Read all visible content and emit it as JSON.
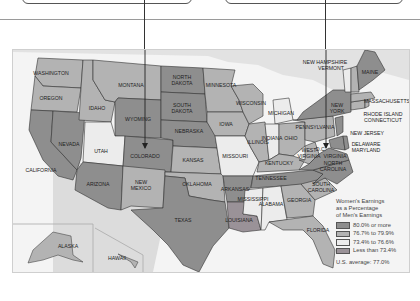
{
  "map": {
    "legend": {
      "title_lines": [
        "Women's Earnings",
        "as a Percentage",
        "of Men's Earnings"
      ],
      "classes": [
        {
          "label": "80.0% or more",
          "color": "#8e8e8e"
        },
        {
          "label": "76.7% to 79.9%",
          "color": "#b3b3b3"
        },
        {
          "label": "73.4% to 76.6%",
          "color": "#ececec"
        },
        {
          "label": "Less than 73.4%",
          "color": "#9a9298"
        }
      ],
      "average": "U.S. average: 77.0%"
    },
    "states": {
      "washington": "WASHINGTON",
      "oregon": "OREGON",
      "california": "CALIFORNIA",
      "nevada": "NEVADA",
      "idaho": "IDAHO",
      "montana": "MONTANA",
      "wyoming": "WYOMING",
      "utah": "UTAH",
      "colorado": "COLORADO",
      "arizona": "ARIZONA",
      "new_mexico_1": "NEW",
      "new_mexico_2": "MEXICO",
      "north_dakota_1": "NORTH",
      "north_dakota_2": "DAKOTA",
      "south_dakota_1": "SOUTH",
      "south_dakota_2": "DAKOTA",
      "nebraska": "NEBRASKA",
      "kansas": "KANSAS",
      "oklahoma": "OKLAHOMA",
      "texas": "TEXAS",
      "minnesota": "MINNESOTA",
      "iowa": "IOWA",
      "missouri": "MISSOURI",
      "arkansas": "ARKANSAS",
      "louisiana": "LOUISIANA",
      "wisconsin": "WISCONSIN",
      "illinois": "ILLINOIS",
      "michigan": "MICHIGAN",
      "indiana": "INDIANA",
      "ohio": "OHIO",
      "kentucky": "KENTUCKY",
      "tennessee": "TENNESSEE",
      "mississippi": "MISSISSIPPI",
      "alabama": "ALABAMA",
      "georgia": "GEORGIA",
      "florida": "FLORIDA",
      "south_carolina_1": "SOUTH",
      "south_carolina_2": "CAROLINA",
      "north_carolina_1": "NORTH",
      "north_carolina_2": "CAROLINA",
      "virginia": "VIRGINIA",
      "west_virginia_1": "WEST",
      "west_virginia_2": "VIRGINIA",
      "dc": "D.C.",
      "pennsylvania": "PENNSYLVANIA",
      "new_york_1": "NEW",
      "new_york_2": "YORK",
      "new_jersey": "NEW JERSEY",
      "delaware": "DELAWARE",
      "maryland": "MARYLAND",
      "connecticut": "CONNECTICUT",
      "rhode_island": "RHODE ISLAND",
      "massachusetts": "MASSACHUSETTS",
      "vermont": "VERMONT",
      "new_hampshire": "NEW HAMPSHIRE",
      "maine": "MAINE",
      "alaska": "ALASKA",
      "hawaii": "HAWAII"
    }
  }
}
